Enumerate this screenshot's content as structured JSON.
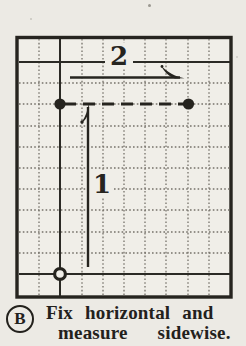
{
  "figure": {
    "labels": {
      "horizontal_measure": "2",
      "vertical_measure": "1"
    },
    "caption": {
      "badge": "B",
      "line1": "Fix horizontal and",
      "line2": "measure sidewise."
    },
    "colors": {
      "paper": "#ECEAE4",
      "panel_paper": "#F0EEE8",
      "ink": "#26241F",
      "grid_gray": "#75726A"
    }
  }
}
